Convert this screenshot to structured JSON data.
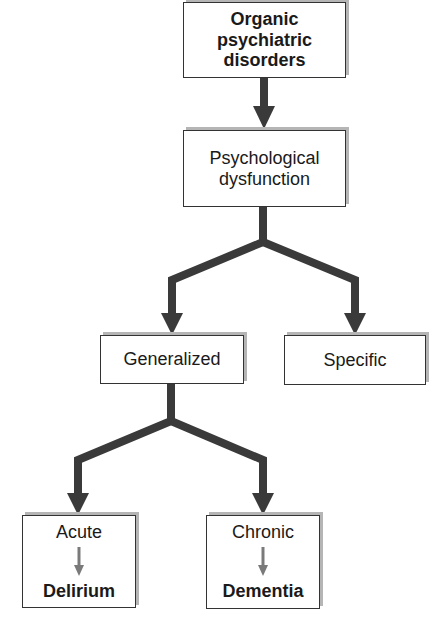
{
  "nodes": {
    "root": {
      "lines": [
        "Organic",
        "psychiatric",
        "disorders"
      ]
    },
    "psych": {
      "lines": [
        "Psychological",
        "dysfunction"
      ]
    },
    "generalized": {
      "label": "Generalized"
    },
    "specific": {
      "label": "Specific"
    },
    "acute": {
      "label": "Acute",
      "result": "Delirium"
    },
    "chronic": {
      "label": "Chronic",
      "result": "Dementia"
    }
  },
  "colors": {
    "connector": "#3a3a3a",
    "inner_arrow": "#7a7a7a",
    "box_border": "#333333",
    "box_shadow": "#b5b5b5"
  }
}
